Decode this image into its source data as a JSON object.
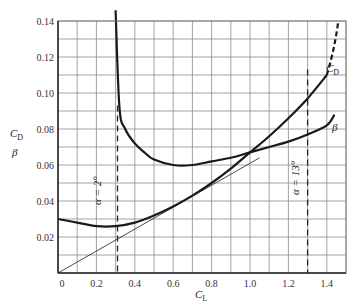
{
  "chart_data": {
    "type": "line",
    "title": "",
    "xlabel": "C_L",
    "ylabel": "C_D / β",
    "xlim": [
      0,
      1.5
    ],
    "ylim": [
      0,
      0.14
    ],
    "grid": true,
    "x_ticks": [
      0,
      0.2,
      0.4,
      0.6,
      0.8,
      1.0,
      1.2,
      1.4
    ],
    "x_tick_labels": [
      "0",
      "0.2",
      "0.4",
      "0.6",
      "0.8",
      "1.0",
      "1.2",
      "1.4"
    ],
    "y_ticks": [
      0.02,
      0.04,
      0.06,
      0.08,
      0.1,
      0.12,
      0.14
    ],
    "y_tick_labels": [
      "0.02",
      "0.04",
      "0.06",
      "0.08",
      "0.10",
      "0.12",
      "0.14"
    ],
    "series": [
      {
        "name": "C_D",
        "label": "C_D",
        "x": [
          0,
          0.1,
          0.2,
          0.3,
          0.4,
          0.5,
          0.6,
          0.7,
          0.8,
          0.9,
          1.0,
          1.1,
          1.2,
          1.3,
          1.4
        ],
        "values": [
          0.03,
          0.028,
          0.026,
          0.026,
          0.028,
          0.032,
          0.037,
          0.043,
          0.05,
          0.058,
          0.067,
          0.076,
          0.086,
          0.097,
          0.11
        ],
        "dashed_extension": {
          "x": [
            1.4,
            1.46
          ],
          "values": [
            0.11,
            0.14
          ]
        }
      },
      {
        "name": "β",
        "label": "β",
        "x": [
          0.3,
          0.32,
          0.35,
          0.4,
          0.45,
          0.5,
          0.6,
          0.7,
          0.8,
          0.9,
          1.0,
          1.1,
          1.2,
          1.3,
          1.4,
          1.44
        ],
        "values": [
          0.146,
          0.092,
          0.08,
          0.072,
          0.067,
          0.063,
          0.06,
          0.06,
          0.062,
          0.064,
          0.067,
          0.07,
          0.073,
          0.077,
          0.082,
          0.088
        ]
      },
      {
        "name": "tangent",
        "label": "",
        "x": [
          0,
          1.05
        ],
        "values": [
          0,
          0.064
        ]
      }
    ],
    "annotations": [
      {
        "text": "α = 2°",
        "x": 0.31,
        "y_from": 0,
        "y_to": 0.093,
        "style": "dashed-vertical"
      },
      {
        "text": "α = 13°",
        "x": 1.3,
        "y_from": 0,
        "y_to": 0.113,
        "style": "dashed-vertical"
      }
    ],
    "curve_labels": [
      {
        "text": "C_D",
        "x": 1.43,
        "y": 0.108
      },
      {
        "text": "β",
        "x": 1.47,
        "y": 0.081
      }
    ]
  },
  "labels": {
    "y_cd": "C",
    "y_cd_sub": "D",
    "y_beta": "β",
    "x_cl": "C",
    "x_cl_sub": "L",
    "curve_cd": "C",
    "curve_cd_sub": "D",
    "curve_beta": "β",
    "alpha2": "α = 2°",
    "alpha13": "α = 13°"
  }
}
